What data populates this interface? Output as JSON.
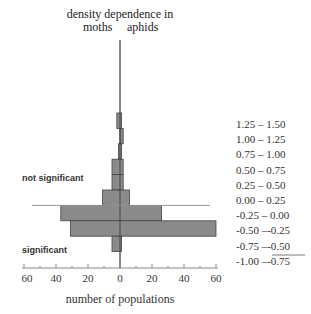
{
  "chart_data": {
    "type": "bar",
    "orientation": "horizontal-back-to-back",
    "title": "density dependence in",
    "left_series_label": "moths",
    "right_series_label": "aphids",
    "xlabel": "number of populations",
    "ylabel": "",
    "x_ticks": [
      "60",
      "40",
      "20",
      "0",
      "20",
      "40",
      "60"
    ],
    "xlim": [
      -60,
      60
    ],
    "categories": [
      "1.25 – 1.50",
      "1.00 – 1.25",
      "0.75 – 1.00",
      "0.50 – 0.75",
      "0.25 – 0.50",
      "0.00 – 0.25",
      "-0.25 – 0.00",
      "-0.50 –-0.25",
      "-0.75 –-0.50",
      "-1.00 –-0.75"
    ],
    "series": [
      {
        "name": "moths",
        "values": [
          2,
          0,
          1,
          5,
          5,
          11,
          37,
          31,
          5,
          0
        ]
      },
      {
        "name": "aphids",
        "values": [
          1,
          2,
          1,
          2,
          2,
          6,
          26,
          60,
          1,
          0
        ]
      }
    ],
    "annotations": {
      "upper_region": "not significant",
      "lower_region": "significant",
      "threshold_between": [
        "0.00 – 0.25",
        "-0.25 – 0.00"
      ]
    },
    "grid": false,
    "bar_color": "#8a8a8a",
    "outline_color": "#444444"
  },
  "labels": {
    "title": "density dependence in",
    "moths": "moths",
    "aphids": "aphids",
    "not_significant": "not significant",
    "significant": "significant",
    "xlabel": "number of populations"
  }
}
